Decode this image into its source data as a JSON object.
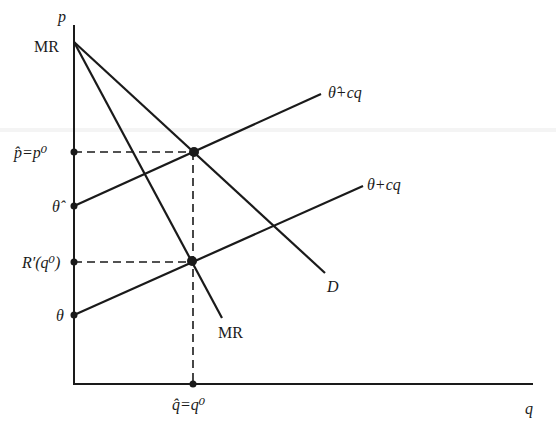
{
  "diagram": {
    "type": "economics-pricing-diagram",
    "axes": {
      "y_label": "p",
      "x_label": "q"
    },
    "y_axis_labels": [
      {
        "id": "intercept",
        "text": "MR",
        "italic": false
      },
      {
        "id": "p-hat",
        "text": "p̂=p⁰",
        "italic": true
      },
      {
        "id": "theta-hat",
        "text": "θ̂",
        "italic": true
      },
      {
        "id": "r-prime",
        "text": "R′(q⁰)",
        "italic": true
      },
      {
        "id": "theta",
        "text": "θ",
        "italic": true
      }
    ],
    "x_axis_labels": [
      {
        "id": "q-hat",
        "text": "q̂=q⁰",
        "italic": true
      }
    ],
    "curves": [
      {
        "id": "demand",
        "label": "D",
        "italic": true,
        "style": "solid"
      },
      {
        "id": "marginal-revenue",
        "label": "MR",
        "italic": false,
        "style": "solid"
      },
      {
        "id": "cost-theta-hat",
        "label": "θ̂+cq",
        "italic": true,
        "style": "solid"
      },
      {
        "id": "cost-theta",
        "label": "θ+cq",
        "italic": true,
        "style": "solid"
      }
    ],
    "points": [
      {
        "id": "equilibrium-upper",
        "description": "D intersects θ̂+cq"
      },
      {
        "id": "equilibrium-lower",
        "description": "MR intersects θ+cq"
      }
    ],
    "colors": {
      "line": "#1a1a1a",
      "background": "#ffffff"
    }
  }
}
